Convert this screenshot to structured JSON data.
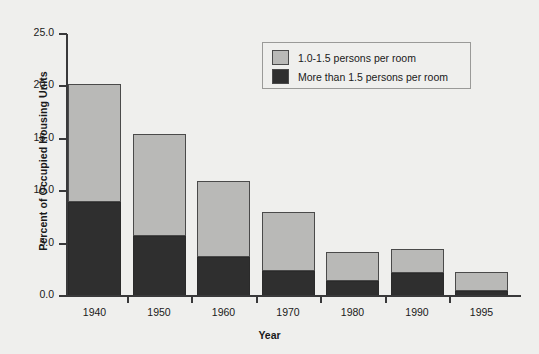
{
  "chart_data": {
    "type": "bar",
    "subtype": "stacked-bar",
    "title": "",
    "xlabel": "Year",
    "ylabel": "Percent of Occupied Housing Units",
    "categories": [
      "1940",
      "1950",
      "1960",
      "1970",
      "1980",
      "1990",
      "1995"
    ],
    "series": [
      {
        "name": "More than 1.5 persons per room",
        "color": "#2f2f2f",
        "values": [
          9.0,
          5.7,
          3.7,
          2.4,
          1.4,
          2.2,
          0.5
        ]
      },
      {
        "name": "1.0-1.5 persons per room",
        "color": "#b9b9b7",
        "values": [
          11.2,
          9.8,
          7.3,
          5.6,
          2.8,
          2.3,
          1.8
        ]
      }
    ],
    "stack_totals": [
      20.2,
      15.5,
      11.0,
      8.0,
      4.2,
      4.5,
      2.3
    ],
    "stack_order_bottom_to_top": [
      "More than 1.5 persons per room",
      "1.0-1.5 persons per room"
    ],
    "ylim": [
      0.0,
      25.0
    ],
    "ytick_values": [
      0.0,
      5.0,
      10.0,
      15.0,
      20.0,
      25.0
    ],
    "ytick_labels": [
      "0.0",
      "5.0",
      "10.0",
      "15.0",
      "20.0",
      "25.0"
    ],
    "grid": false,
    "legend_position": "top-right"
  },
  "axes": {
    "y_title": "Percent of Occupied Housing Units",
    "x_title": "Year"
  },
  "legend": {
    "entries": [
      {
        "label": "1.0-1.5 persons per room",
        "color": "#b9b9b7"
      },
      {
        "label": "More than 1.5 persons per room",
        "color": "#2f2f2f"
      }
    ]
  }
}
